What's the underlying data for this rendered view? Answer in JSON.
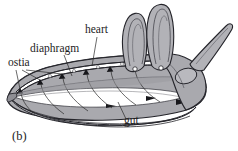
{
  "figure": {
    "caption": "(b)",
    "background_color": "#ffffff",
    "ink_color": "#24242a",
    "body_fill": "#a9a9ae",
    "body_fill_light": "#c3c3c7",
    "body_fill_dark": "#8e8e94",
    "cavity_fill": "#ffffff",
    "labels": [
      {
        "id": "ostia",
        "text": "ostia",
        "x": 8,
        "y": 66
      },
      {
        "id": "diaphragm",
        "text": "diaphragm",
        "x": 30,
        "y": 52
      },
      {
        "id": "heart",
        "text": "heart",
        "x": 85,
        "y": 33
      },
      {
        "id": "gut",
        "text": "gut",
        "x": 124,
        "y": 124
      }
    ],
    "structures": [
      {
        "id": "dorsal-vessel",
        "name": "heart / dorsal vessel"
      },
      {
        "id": "ostia-valves",
        "name": "ostia"
      },
      {
        "id": "dorsal-diaphragm",
        "name": "diaphragm"
      },
      {
        "id": "gut-tube",
        "name": "gut"
      },
      {
        "id": "antenna-left",
        "name": "antenna"
      },
      {
        "id": "antenna-right",
        "name": "antenna"
      },
      {
        "id": "posterior-appendage",
        "name": "appendage"
      },
      {
        "id": "eye",
        "name": "eye"
      }
    ],
    "ostia_count": 6,
    "diaphragm_fan_count": 6
  }
}
